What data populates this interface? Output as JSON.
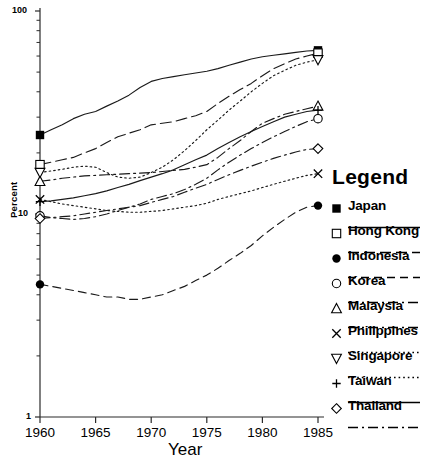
{
  "chart_data": {
    "type": "line",
    "title": "",
    "xlabel": "Year",
    "ylabel": "Percent",
    "yscale": "log",
    "ylim": [
      1,
      100
    ],
    "xlim": [
      1960,
      1985
    ],
    "xticks": [
      1960,
      1965,
      1970,
      1975,
      1980,
      1985
    ],
    "yticks": [
      1,
      10,
      100
    ],
    "ytick_labels": [
      "1",
      "10",
      "100"
    ],
    "grid": false,
    "legend_position": "right",
    "legend_title": "Legend",
    "x": [
      1960,
      1961,
      1962,
      1963,
      1964,
      1965,
      1966,
      1967,
      1968,
      1969,
      1970,
      1971,
      1972,
      1973,
      1974,
      1975,
      1976,
      1977,
      1978,
      1979,
      1980,
      1981,
      1982,
      1983,
      1984,
      1985
    ],
    "series": [
      {
        "name": "Japan",
        "marker": "filled-square",
        "linestyle": "solid",
        "values": [
          24.5,
          26.0,
          27.5,
          29.5,
          31.0,
          32.0,
          34.0,
          36.0,
          38.5,
          42.0,
          45.0,
          46.5,
          47.5,
          48.5,
          49.5,
          50.5,
          52.0,
          54.0,
          56.0,
          58.0,
          59.5,
          60.5,
          61.5,
          62.5,
          63.5,
          64.0
        ]
      },
      {
        "name": "Hong Kong",
        "marker": "open-square",
        "linestyle": "long-dash",
        "values": [
          17.5,
          18.0,
          18.5,
          19.0,
          20.0,
          21.0,
          22.5,
          24.0,
          25.0,
          26.0,
          27.5,
          28.0,
          28.5,
          29.5,
          30.5,
          32.0,
          35.0,
          38.0,
          41.0,
          44.0,
          48.0,
          52.0,
          55.0,
          58.0,
          60.0,
          62.0
        ]
      },
      {
        "name": "Indonesia",
        "marker": "filled-circle",
        "linestyle": "dashed",
        "values": [
          4.5,
          4.4,
          4.3,
          4.2,
          4.1,
          4.0,
          3.9,
          3.9,
          3.8,
          3.8,
          3.9,
          4.0,
          4.2,
          4.4,
          4.7,
          5.0,
          5.4,
          5.9,
          6.4,
          7.0,
          7.8,
          8.6,
          9.4,
          10.2,
          10.8,
          11.0
        ]
      },
      {
        "name": "Korea",
        "marker": "open-circle",
        "linestyle": "dash-dot",
        "values": [
          9.8,
          9.6,
          9.5,
          9.4,
          9.5,
          9.7,
          10.0,
          10.4,
          10.8,
          11.2,
          11.8,
          12.2,
          12.6,
          13.2,
          14.0,
          15.0,
          16.5,
          18.0,
          19.5,
          21.0,
          22.5,
          24.0,
          25.5,
          27.0,
          28.5,
          29.5
        ]
      },
      {
        "name": "Malaysia",
        "marker": "open-triangle-up",
        "linestyle": "dash-dot",
        "values": [
          14.5,
          14.7,
          15.0,
          15.2,
          15.4,
          15.5,
          15.6,
          15.7,
          15.8,
          15.9,
          16.0,
          16.2,
          16.4,
          16.6,
          17.0,
          17.5,
          19.0,
          21.0,
          23.0,
          25.5,
          28.0,
          29.5,
          31.0,
          32.0,
          33.0,
          34.0
        ]
      },
      {
        "name": "Philippines",
        "marker": "cross",
        "linestyle": "dotted",
        "values": [
          11.8,
          11.5,
          11.2,
          11.0,
          10.8,
          10.6,
          10.4,
          10.3,
          10.2,
          10.2,
          10.3,
          10.4,
          10.6,
          10.8,
          11.0,
          11.3,
          11.8,
          12.2,
          12.6,
          13.0,
          13.5,
          14.0,
          14.5,
          15.0,
          15.5,
          15.8
        ]
      },
      {
        "name": "Singapore",
        "marker": "open-triangle-down",
        "linestyle": "dotted",
        "values": [
          16.0,
          16.3,
          16.6,
          17.0,
          17.2,
          17.0,
          16.0,
          15.2,
          15.0,
          15.2,
          16.0,
          17.0,
          18.5,
          20.5,
          23.0,
          26.0,
          29.0,
          32.5,
          36.0,
          40.0,
          44.0,
          48.0,
          51.0,
          54.0,
          56.0,
          57.5
        ]
      },
      {
        "name": "Taiwan",
        "marker": "plus",
        "linestyle": "solid",
        "values": [
          11.5,
          11.6,
          11.8,
          12.0,
          12.3,
          12.6,
          13.0,
          13.5,
          14.0,
          14.6,
          15.2,
          15.8,
          16.5,
          17.5,
          18.5,
          19.5,
          21.0,
          22.5,
          24.0,
          25.5,
          27.0,
          28.5,
          30.0,
          31.0,
          32.0,
          32.5
        ]
      },
      {
        "name": "Thailand",
        "marker": "open-diamond",
        "linestyle": "dash-dot",
        "values": [
          9.5,
          9.6,
          9.7,
          9.8,
          10.0,
          10.2,
          10.4,
          10.6,
          10.8,
          11.0,
          11.4,
          11.8,
          12.2,
          12.8,
          13.4,
          14.0,
          14.8,
          15.6,
          16.4,
          17.2,
          18.0,
          18.8,
          19.5,
          20.2,
          20.8,
          21.0
        ]
      }
    ]
  },
  "axes": {
    "x_title": "Year",
    "y_title": "Percent",
    "x_tick_labels": [
      "1960",
      "1965",
      "1970",
      "1975",
      "1980",
      "1985"
    ],
    "y_tick_labels": [
      "100",
      "10",
      "1"
    ]
  },
  "legend": {
    "title": "Legend",
    "items": [
      {
        "label": "Japan",
        "marker": "filled-square",
        "linestyle": "solid"
      },
      {
        "label": "Hong Kong",
        "marker": "open-square",
        "linestyle": "long-dash"
      },
      {
        "label": "Indonesia",
        "marker": "filled-circle",
        "linestyle": "dashed"
      },
      {
        "label": "Korea",
        "marker": "open-circle",
        "linestyle": "dash-dot"
      },
      {
        "label": "Malaysia",
        "marker": "open-triangle-up",
        "linestyle": "dash-dot"
      },
      {
        "label": "Philippines",
        "marker": "cross",
        "linestyle": "dotted"
      },
      {
        "label": "Singapore",
        "marker": "open-triangle-down",
        "linestyle": "dotted"
      },
      {
        "label": "Taiwan",
        "marker": "plus",
        "linestyle": "solid"
      },
      {
        "label": "Thailand",
        "marker": "open-diamond",
        "linestyle": "dash-dot"
      }
    ]
  },
  "colors": {
    "ink": "#000000",
    "background": "#ffffff"
  }
}
